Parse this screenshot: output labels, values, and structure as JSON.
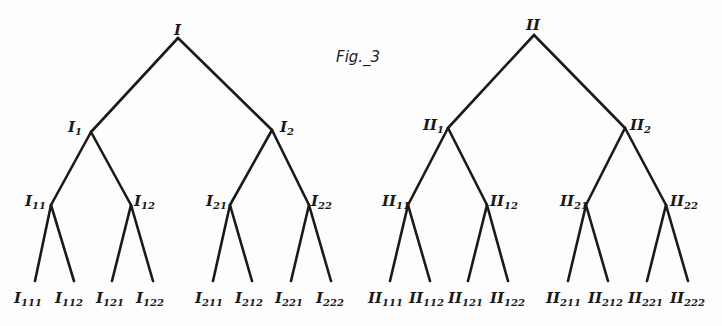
{
  "figure": {
    "caption": "Fig._3",
    "caption_pos": [
      336,
      62
    ]
  },
  "trees": [
    {
      "name": "tree-I",
      "nodes": [
        {
          "id": "I",
          "base": "I",
          "sub": "",
          "x": 178,
          "y": 38,
          "lx": 174,
          "ly": 35,
          "parent": null
        },
        {
          "id": "I1",
          "base": "I",
          "sub": "1",
          "x": 91,
          "y": 132,
          "lx": 68,
          "ly": 132,
          "parent": "I"
        },
        {
          "id": "I2",
          "base": "I",
          "sub": "2",
          "x": 272,
          "y": 130,
          "lx": 280,
          "ly": 132,
          "parent": "I"
        },
        {
          "id": "I11",
          "base": "I",
          "sub": "11",
          "x": 51,
          "y": 205,
          "lx": 25,
          "ly": 206,
          "parent": "I1"
        },
        {
          "id": "I12",
          "base": "I",
          "sub": "12",
          "x": 131,
          "y": 205,
          "lx": 134,
          "ly": 206,
          "parent": "I1"
        },
        {
          "id": "I21",
          "base": "I",
          "sub": "21",
          "x": 230,
          "y": 205,
          "lx": 206,
          "ly": 206,
          "parent": "I2"
        },
        {
          "id": "I22",
          "base": "I",
          "sub": "22",
          "x": 309,
          "y": 205,
          "lx": 311,
          "ly": 206,
          "parent": "I2"
        },
        {
          "id": "I111",
          "base": "I",
          "sub": "111",
          "x": 35,
          "y": 281,
          "lx": 14,
          "ly": 303,
          "parent": "I11"
        },
        {
          "id": "I112",
          "base": "I",
          "sub": "112",
          "x": 74,
          "y": 281,
          "lx": 55,
          "ly": 303,
          "parent": "I11"
        },
        {
          "id": "I121",
          "base": "I",
          "sub": "121",
          "x": 112,
          "y": 281,
          "lx": 96,
          "ly": 303,
          "parent": "I12"
        },
        {
          "id": "I122",
          "base": "I",
          "sub": "122",
          "x": 153,
          "y": 281,
          "lx": 136,
          "ly": 303,
          "parent": "I12"
        },
        {
          "id": "I211",
          "base": "I",
          "sub": "211",
          "x": 213,
          "y": 281,
          "lx": 195,
          "ly": 303,
          "parent": "I21"
        },
        {
          "id": "I212",
          "base": "I",
          "sub": "212",
          "x": 252,
          "y": 281,
          "lx": 235,
          "ly": 303,
          "parent": "I21"
        },
        {
          "id": "I221",
          "base": "I",
          "sub": "221",
          "x": 291,
          "y": 281,
          "lx": 275,
          "ly": 303,
          "parent": "I22"
        },
        {
          "id": "I222",
          "base": "I",
          "sub": "222",
          "x": 331,
          "y": 281,
          "lx": 316,
          "ly": 303,
          "parent": "I22"
        }
      ]
    },
    {
      "name": "tree-II",
      "nodes": [
        {
          "id": "II",
          "base": "II",
          "sub": "",
          "x": 534,
          "y": 35,
          "lx": 526,
          "ly": 30,
          "parent": null
        },
        {
          "id": "II1",
          "base": "II",
          "sub": "1",
          "x": 448,
          "y": 128,
          "lx": 423,
          "ly": 130,
          "parent": "II"
        },
        {
          "id": "II2",
          "base": "II",
          "sub": "2",
          "x": 625,
          "y": 128,
          "lx": 630,
          "ly": 130,
          "parent": "II"
        },
        {
          "id": "II11",
          "base": "II",
          "sub": "11",
          "x": 408,
          "y": 205,
          "lx": 382,
          "ly": 206,
          "parent": "II1"
        },
        {
          "id": "II12",
          "base": "II",
          "sub": "12",
          "x": 487,
          "y": 205,
          "lx": 490,
          "ly": 206,
          "parent": "II1"
        },
        {
          "id": "II21",
          "base": "II",
          "sub": "21",
          "x": 586,
          "y": 205,
          "lx": 560,
          "ly": 206,
          "parent": "II2"
        },
        {
          "id": "II22",
          "base": "II",
          "sub": "22",
          "x": 666,
          "y": 205,
          "lx": 670,
          "ly": 206,
          "parent": "II2"
        },
        {
          "id": "II111",
          "base": "II",
          "sub": "111",
          "x": 390,
          "y": 281,
          "lx": 368,
          "ly": 303,
          "parent": "II11"
        },
        {
          "id": "II112",
          "base": "II",
          "sub": "112",
          "x": 430,
          "y": 281,
          "lx": 409,
          "ly": 303,
          "parent": "II11"
        },
        {
          "id": "II121",
          "base": "II",
          "sub": "121",
          "x": 468,
          "y": 281,
          "lx": 448,
          "ly": 303,
          "parent": "II12"
        },
        {
          "id": "II122",
          "base": "II",
          "sub": "122",
          "x": 508,
          "y": 281,
          "lx": 490,
          "ly": 303,
          "parent": "II12"
        },
        {
          "id": "II211",
          "base": "II",
          "sub": "211",
          "x": 568,
          "y": 281,
          "lx": 546,
          "ly": 303,
          "parent": "II21"
        },
        {
          "id": "II212",
          "base": "II",
          "sub": "212",
          "x": 608,
          "y": 281,
          "lx": 588,
          "ly": 303,
          "parent": "II21"
        },
        {
          "id": "II221",
          "base": "II",
          "sub": "221",
          "x": 647,
          "y": 281,
          "lx": 628,
          "ly": 303,
          "parent": "II22"
        },
        {
          "id": "II222",
          "base": "II",
          "sub": "222",
          "x": 688,
          "y": 281,
          "lx": 670,
          "ly": 303,
          "parent": "II22"
        }
      ]
    }
  ]
}
